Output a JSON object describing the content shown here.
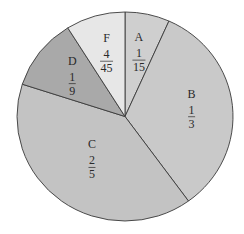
{
  "chart_data": {
    "type": "pie",
    "title": "",
    "start_angle_deg": 0,
    "direction": "clockwise",
    "slices": [
      {
        "label": "A",
        "numerator": "1",
        "denominator": "15",
        "value": 0.0667,
        "color": "#cfcfcf"
      },
      {
        "label": "B",
        "numerator": "1",
        "denominator": "3",
        "value": 0.3333,
        "color": "#c9c9c9"
      },
      {
        "label": "C",
        "numerator": "2",
        "denominator": "5",
        "value": 0.4,
        "color": "#c3c3c3"
      },
      {
        "label": "D",
        "numerator": "1",
        "denominator": "9",
        "value": 0.1111,
        "color": "#a9a9a9"
      },
      {
        "label": "F",
        "numerator": "4",
        "denominator": "45",
        "value": 0.0889,
        "color": "#e7e7e7"
      }
    ],
    "legend": "none"
  }
}
